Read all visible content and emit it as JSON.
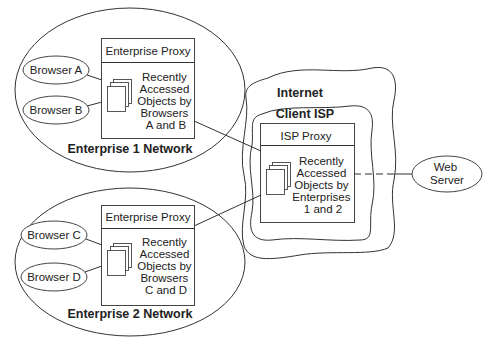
{
  "diagram": {
    "enterprise1": {
      "network_label": "Enterprise 1 Network",
      "proxy_title": "Enterprise Proxy",
      "cache_text": [
        "Recently",
        "Accessed",
        "Objects by",
        "Browsers",
        "A and B"
      ],
      "browsers": [
        "Browser A",
        "Browser B"
      ]
    },
    "enterprise2": {
      "network_label": "Enterprise 2 Network",
      "proxy_title": "Enterprise Proxy",
      "cache_text": [
        "Recently",
        "Accessed",
        "Objects by",
        "Browsers",
        "C and D"
      ],
      "browsers": [
        "Browser C",
        "Browser D"
      ]
    },
    "internet": {
      "label": "Internet",
      "client_isp": {
        "label": "Client ISP",
        "proxy_title": "ISP Proxy",
        "cache_text": [
          "Recently",
          "Accessed",
          "Objects by",
          "Enterprises",
          "1 and 2"
        ]
      }
    },
    "web_server": {
      "label_lines": [
        "Web",
        "Server"
      ]
    },
    "colors": {
      "line": "#333333",
      "background": "#ffffff"
    }
  }
}
